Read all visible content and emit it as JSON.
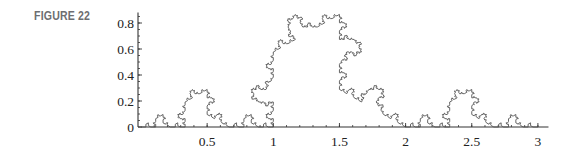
{
  "figure": {
    "label": "FIGURE 22"
  },
  "chart_data": {
    "type": "line",
    "title": "",
    "xlabel": "",
    "ylabel": "",
    "key_vertices": {
      "x": [
        0,
        1,
        1,
        1.5,
        1.5,
        2,
        3
      ],
      "y": [
        0,
        0,
        0.577,
        0.866,
        0.289,
        0,
        0
      ]
    },
    "recursion_depth": 4,
    "xlim": [
      0,
      3.08
    ],
    "ylim": [
      0,
      0.88
    ],
    "x_ticks": [
      0.5,
      1,
      1.5,
      2,
      2.5,
      3
    ],
    "x_tick_labels": [
      "0.5",
      "1",
      "1.5",
      "2",
      "2.5",
      "3"
    ],
    "y_ticks": [
      0,
      0.2,
      0.4,
      0.6,
      0.8
    ],
    "y_tick_labels": [
      "0",
      "0.2",
      "0.4",
      "0.6",
      "0.8"
    ],
    "x_minor_step": 0.1,
    "y_minor_step": 0.05,
    "grid": false,
    "legend": null,
    "line_color": "#555555",
    "axis_color": "#333333"
  }
}
